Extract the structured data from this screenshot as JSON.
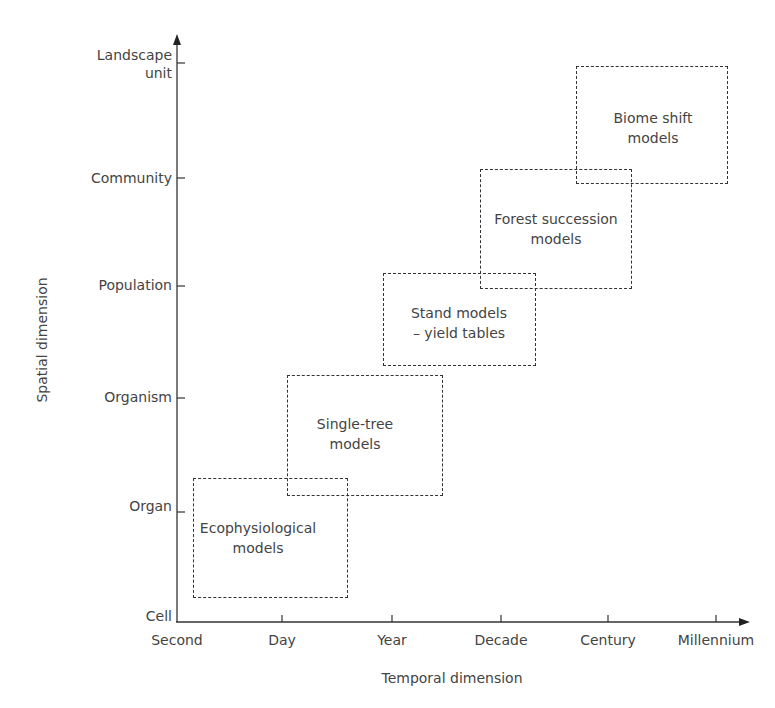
{
  "diagram": {
    "x_axis": {
      "title": "Temporal dimension",
      "ticks": [
        "Second",
        "Day",
        "Year",
        "Decade",
        "Century",
        "Millennium"
      ]
    },
    "y_axis": {
      "title": "Spatial dimension",
      "ticks": [
        "Cell",
        "Organ",
        "Organism",
        "Population",
        "Community",
        "Landscape unit"
      ],
      "tick_lines": {
        "landscape": [
          "Landscape",
          "unit"
        ]
      }
    },
    "boxes": [
      {
        "line1": "Ecophysiological",
        "line2": "models"
      },
      {
        "line1": "Single-tree",
        "line2": "models"
      },
      {
        "line1": "Stand models",
        "line2": "– yield tables"
      },
      {
        "line1": "Forest succession",
        "line2": "models"
      },
      {
        "line1": "Biome shift",
        "line2": "models"
      }
    ]
  }
}
